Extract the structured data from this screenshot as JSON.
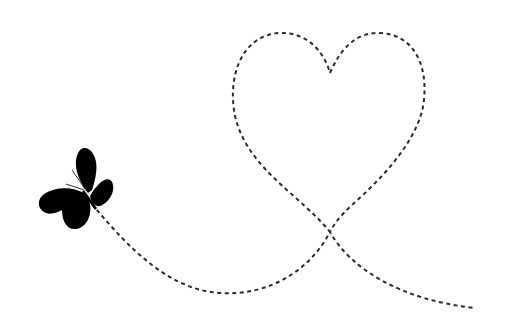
{
  "illustration": {
    "title": "Butterfly flight path forming a heart",
    "background_color": "#ffffff",
    "path_color": "#2b2b2b",
    "butterfly_color": "#000000",
    "elements": [
      {
        "name": "butterfly",
        "icon": "butterfly-icon"
      },
      {
        "name": "dashed-flight-path",
        "style": "dashed"
      },
      {
        "name": "heart-loop",
        "icon": "heart-icon"
      }
    ]
  }
}
